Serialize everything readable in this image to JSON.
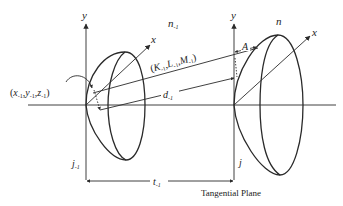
{
  "diagram": {
    "colors": {
      "line": "#2a2a2a",
      "text": "#222222",
      "background": "#ffffff"
    },
    "left_surface": {
      "index_label": "n",
      "index_sub": "-1",
      "axis_y": "y",
      "axis_x": "x",
      "vertex_label": "j",
      "vertex_sub": "-1",
      "point_label": "(x",
      "point_parts": [
        "x",
        "y",
        "z"
      ],
      "point_sub": "-1"
    },
    "right_surface": {
      "index_label": "n",
      "axis_y": "y",
      "axis_x": "x",
      "vertex_label": "j",
      "offset_label": "A"
    },
    "ray": {
      "direction_label": "K",
      "direction_parts": [
        "K",
        "L",
        "M"
      ],
      "direction_sub": "-1",
      "distance_label": "d",
      "distance_sub": "-1"
    },
    "separation": {
      "label": "t",
      "sub": "-1"
    },
    "tangential_plane_label": "Tangential Plane"
  }
}
